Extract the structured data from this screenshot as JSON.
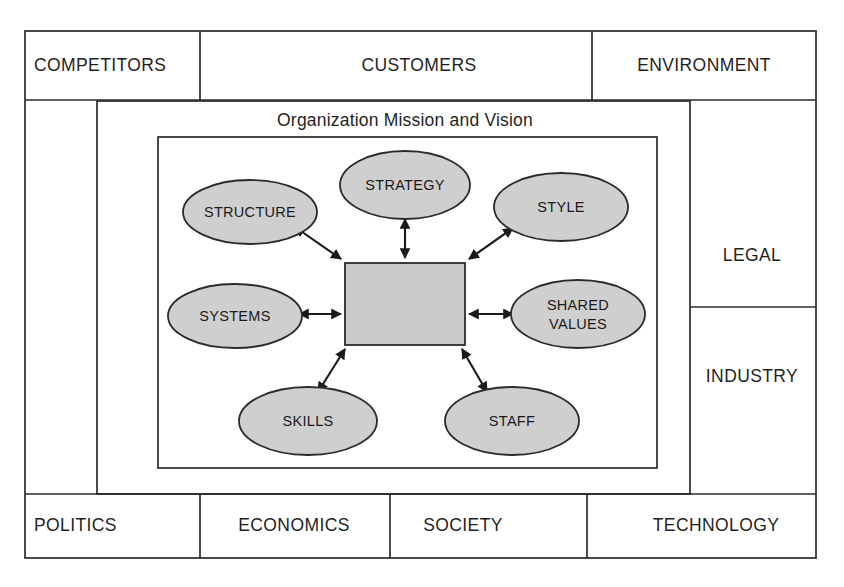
{
  "diagram": {
    "title": "Organization Mission and Vision",
    "center_node": {
      "label": "",
      "shape": "rectangle",
      "fill": "#c9c9c9"
    },
    "colors": {
      "node_fill": "#cfcfcf",
      "center_fill": "#c9c9c9",
      "stroke": "#2b2b2b",
      "background": "#ffffff",
      "text": "#1a1a1a"
    },
    "environment_cells": {
      "top": [
        {
          "label": "COMPETITORS"
        },
        {
          "label": "CUSTOMERS"
        },
        {
          "label": "ENVIRONMENT"
        }
      ],
      "right": [
        {
          "label": "LEGAL"
        },
        {
          "label": "INDUSTRY"
        }
      ],
      "bottom": [
        {
          "label": "POLITICS"
        },
        {
          "label": "ECONOMICS"
        },
        {
          "label": "SOCIETY"
        },
        {
          "label": "TECHNOLOGY"
        }
      ]
    },
    "nodes": [
      {
        "id": "strategy",
        "label": "STRATEGY"
      },
      {
        "id": "structure",
        "label": "STRUCTURE"
      },
      {
        "id": "style",
        "label": "STYLE"
      },
      {
        "id": "systems",
        "label": "SYSTEMS"
      },
      {
        "id": "shared-values",
        "label_line1": "SHARED",
        "label_line2": "VALUES"
      },
      {
        "id": "skills",
        "label": "SKILLS"
      },
      {
        "id": "staff",
        "label": "STAFF"
      }
    ],
    "connections": [
      {
        "from": "center",
        "to": "strategy",
        "type": "double-arrow"
      },
      {
        "from": "center",
        "to": "structure",
        "type": "double-arrow"
      },
      {
        "from": "center",
        "to": "style",
        "type": "double-arrow"
      },
      {
        "from": "center",
        "to": "systems",
        "type": "double-arrow"
      },
      {
        "from": "center",
        "to": "shared-values",
        "type": "double-arrow"
      },
      {
        "from": "center",
        "to": "skills",
        "type": "double-arrow"
      },
      {
        "from": "center",
        "to": "staff",
        "type": "double-arrow"
      }
    ]
  }
}
